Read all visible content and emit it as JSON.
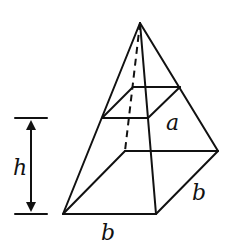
{
  "diagram": {
    "type": "frustum-of-square-pyramid",
    "colors": {
      "stroke": "#111111",
      "background": "#ffffff"
    },
    "labels": {
      "height": "h",
      "top_side": "a",
      "base_front": "b",
      "base_side": "b"
    },
    "points": {
      "apex": [
        140,
        23
      ],
      "base_front_left": [
        63,
        214
      ],
      "base_front_right": [
        156,
        214
      ],
      "base_back_right": [
        218,
        151
      ],
      "base_back_left": [
        125,
        151
      ],
      "top_front_left": [
        102,
        118
      ],
      "top_front_right": [
        148,
        118
      ],
      "top_back_right": [
        180,
        87
      ],
      "top_back_left": [
        133,
        87
      ]
    },
    "height_marker": {
      "x": 31,
      "top_y": 118,
      "bottom_y": 214,
      "bar_x1": 15,
      "bar_x2": 47
    }
  }
}
